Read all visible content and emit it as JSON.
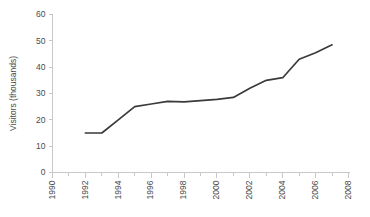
{
  "chart_data": {
    "type": "line",
    "title": "",
    "xlabel": "",
    "ylabel": "Visitors (thousands)",
    "xlim": [
      1990,
      2008
    ],
    "ylim": [
      0,
      60
    ],
    "grid": false,
    "legend": "none",
    "line_color": "#3a3a3a",
    "axis_color": "#c8c8c8",
    "background_color": "#ffffff",
    "x_tick_labels": [
      "1990",
      "1992",
      "1994",
      "1996",
      "1998",
      "2000",
      "2002",
      "2004",
      "2006",
      "2008"
    ],
    "x_tick_values": [
      1990,
      1992,
      1994,
      1996,
      1998,
      2000,
      2002,
      2004,
      2006,
      2008
    ],
    "x_minor_tick_values": [
      1991,
      1993,
      1995,
      1997,
      1999,
      2001,
      2003,
      2005,
      2007
    ],
    "y_tick_labels": [
      "0",
      "10",
      "20",
      "30",
      "40",
      "50",
      "60"
    ],
    "y_tick_values": [
      0,
      10,
      20,
      30,
      40,
      50,
      60
    ],
    "series": [
      {
        "name": "Visitors",
        "x": [
          1992,
          1993,
          1994,
          1995,
          1996,
          1997,
          1998,
          1999,
          2000,
          2001,
          2002,
          2003,
          2004,
          2005,
          2006,
          2007
        ],
        "values": [
          15,
          15,
          20,
          25,
          26,
          27,
          26.8,
          27.3,
          27.8,
          28.5,
          32,
          35,
          36,
          43,
          45.5,
          48.5
        ]
      }
    ]
  }
}
